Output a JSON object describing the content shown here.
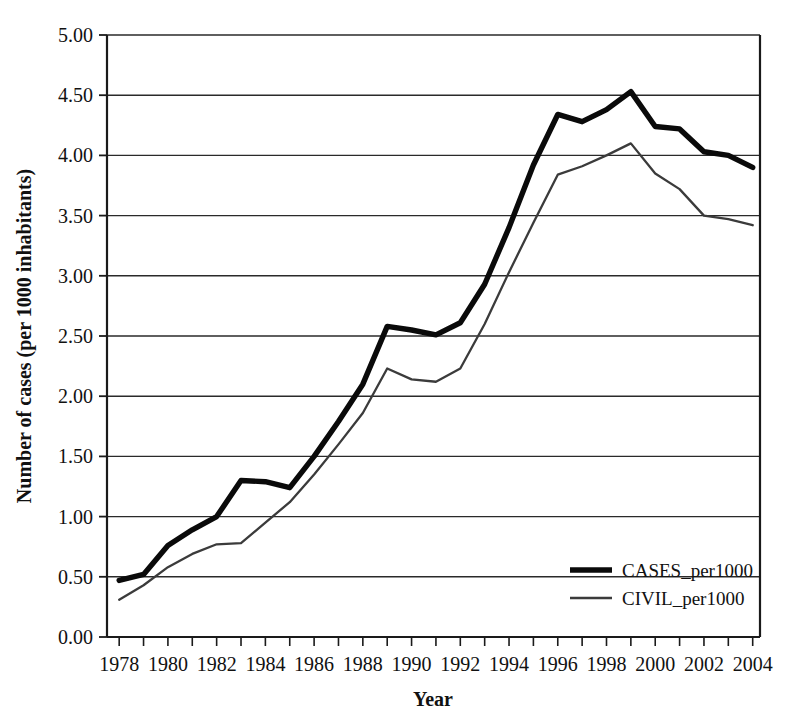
{
  "chart_data": {
    "type": "line",
    "title": "",
    "xlabel": "Year",
    "ylabel": "Number of cases (per 1000 inhabitants)",
    "xlim": [
      1977.5,
      2004.3
    ],
    "ylim": [
      0.0,
      5.0
    ],
    "grid": true,
    "legend_position": "inside-bottom-right",
    "y_ticks": [
      "0.00",
      "0.50",
      "1.00",
      "1.50",
      "2.00",
      "2.50",
      "3.00",
      "3.50",
      "4.00",
      "4.50",
      "5.00"
    ],
    "y_tick_values": [
      0.0,
      0.5,
      1.0,
      1.5,
      2.0,
      2.5,
      3.0,
      3.5,
      4.0,
      4.5,
      5.0
    ],
    "x_ticks": [
      "1978",
      "1980",
      "1982",
      "1984",
      "1986",
      "1988",
      "1990",
      "1992",
      "1994",
      "1996",
      "1998",
      "2000",
      "2002",
      "2004"
    ],
    "x_tick_values": [
      1978,
      1980,
      1982,
      1984,
      1986,
      1988,
      1990,
      1992,
      1994,
      1996,
      1998,
      2000,
      2002,
      2004
    ],
    "x_minor_step": 1,
    "x": [
      1978,
      1979,
      1980,
      1981,
      1982,
      1983,
      1984,
      1985,
      1986,
      1987,
      1988,
      1989,
      1990,
      1991,
      1992,
      1993,
      1994,
      1995,
      1996,
      1997,
      1998,
      1999,
      2000,
      2001,
      2002,
      2003,
      2004
    ],
    "series": [
      {
        "name": "CASES_per1000",
        "style": "thick",
        "color": "#0a0a0a",
        "values": [
          0.47,
          0.52,
          0.76,
          0.89,
          1.0,
          1.3,
          1.29,
          1.24,
          1.5,
          1.79,
          2.1,
          2.58,
          2.55,
          2.51,
          2.61,
          2.93,
          3.4,
          3.92,
          4.34,
          4.28,
          4.38,
          4.53,
          4.24,
          4.22,
          4.03,
          4.0,
          3.9
        ]
      },
      {
        "name": "CIVIL_per1000",
        "style": "thin",
        "color": "#3b3b3b",
        "values": [
          0.31,
          0.43,
          0.58,
          0.69,
          0.77,
          0.78,
          0.95,
          1.12,
          1.35,
          1.6,
          1.86,
          2.23,
          2.14,
          2.12,
          2.23,
          2.6,
          3.03,
          3.44,
          3.84,
          3.91,
          4.0,
          4.1,
          3.85,
          3.72,
          3.5,
          3.47,
          3.42
        ]
      }
    ]
  },
  "legend": {
    "entries": [
      {
        "label": "CASES_per1000"
      },
      {
        "label": "CIVIL_per1000"
      }
    ]
  },
  "axes": {
    "x_title": "Year",
    "y_title": "Number of cases (per 1000 inhabitants)"
  }
}
